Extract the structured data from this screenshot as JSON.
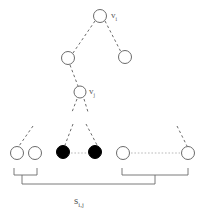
{
  "figure": {
    "colors": {
      "stroke": "#6b6b6b",
      "node_fill_open": "#ffffff",
      "node_fill_closed": "#000000",
      "label_color": "#5a5a5a",
      "background": "#ffffff"
    }
  },
  "labels": {
    "root_node": {
      "base": "v",
      "sub": "i",
      "text": "v i"
    },
    "inner_node": {
      "base": "v",
      "sub": "j",
      "text": "v j"
    },
    "bracket_span": {
      "base": "s",
      "sub": "i,j",
      "text": "s i,j"
    }
  },
  "tree": {
    "nodes": [
      {
        "id": "root",
        "name": "node-root-vi",
        "cx": 100,
        "cy": 16,
        "r": 6.5,
        "fill": "open",
        "label": "v_i"
      },
      {
        "id": "mid-l",
        "name": "node-mid-left",
        "cx": 68,
        "cy": 58,
        "r": 6.5,
        "fill": "open",
        "label": ""
      },
      {
        "id": "mid-r",
        "name": "node-mid-right",
        "cx": 125,
        "cy": 57,
        "r": 6.5,
        "fill": "open",
        "label": ""
      },
      {
        "id": "vj",
        "name": "node-inner-vj",
        "cx": 80,
        "cy": 92,
        "r": 6.0,
        "fill": "open",
        "label": "v_j"
      }
    ],
    "edges": [
      {
        "name": "edge-root-to-mid-left",
        "x1": 95,
        "y1": 21,
        "x2": 73,
        "y2": 53
      },
      {
        "name": "edge-root-to-mid-right",
        "x1": 105,
        "y1": 21,
        "x2": 121,
        "y2": 52
      },
      {
        "name": "edge-mid-left-to-vj",
        "x1": 70,
        "y1": 65,
        "x2": 78,
        "y2": 86
      }
    ]
  },
  "leaves": {
    "row_y": 153,
    "items": [
      {
        "name": "leaf-1",
        "cx": 17,
        "cy": 153,
        "r": 6.5,
        "fill": "open"
      },
      {
        "name": "leaf-2",
        "cx": 35,
        "cy": 153,
        "r": 6.5,
        "fill": "open"
      },
      {
        "name": "leaf-3",
        "cx": 63,
        "cy": 152,
        "r": 6.5,
        "fill": "closed"
      },
      {
        "name": "leaf-4",
        "cx": 95,
        "cy": 152,
        "r": 6.5,
        "fill": "closed"
      },
      {
        "name": "leaf-5",
        "cx": 123,
        "cy": 153,
        "r": 6.5,
        "fill": "open"
      },
      {
        "name": "leaf-6",
        "cx": 188,
        "cy": 153,
        "r": 6.5,
        "fill": "open"
      }
    ],
    "leaf_edges": [
      {
        "name": "leaf-edge-to-leaf-1",
        "x1": 33,
        "y1": 126,
        "x2": 19,
        "y2": 146
      },
      {
        "name": "leaf-edge-to-leaf-3",
        "x1": 73,
        "y1": 124,
        "x2": 65,
        "y2": 145
      },
      {
        "name": "leaf-edge-to-leaf-4",
        "x1": 86,
        "y1": 124,
        "x2": 97,
        "y2": 145
      },
      {
        "name": "leaf-edge-to-leaf-6",
        "x1": 177,
        "y1": 126,
        "x2": 187,
        "y2": 146
      }
    ],
    "horizontal_links": [
      {
        "name": "link-leaf-3-to-leaf-4",
        "x1": 71,
        "y1": 153,
        "x2": 87,
        "y2": 153
      },
      {
        "name": "link-leaf-5-to-leaf-6",
        "x1": 131,
        "y1": 153,
        "x2": 180,
        "y2": 153
      }
    ]
  },
  "brackets": [
    {
      "name": "bracket-left-group",
      "x1": 14,
      "x2": 37,
      "top": 168,
      "depth": 7
    },
    {
      "name": "bracket-right-group",
      "x1": 122,
      "x2": 188,
      "top": 168,
      "depth": 7
    },
    {
      "name": "bracket-span-sij",
      "x1": 22,
      "x2": 155,
      "top": 183,
      "depth": 7
    }
  ]
}
